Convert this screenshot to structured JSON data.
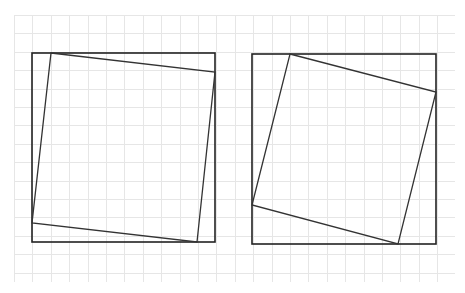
{
  "diagram": {
    "background": "#ffffff",
    "grid": {
      "x0": 14,
      "y0": 15,
      "x1": 455,
      "y1": 282,
      "spacing": 18.4,
      "color": "#e6e6e6"
    },
    "colors": {
      "outer_stroke": "#222222",
      "inner_stroke": "#333333"
    },
    "figures": [
      {
        "name": "left-figure",
        "outer_square": {
          "x": 32,
          "y": 53,
          "width": 183,
          "height": 189
        },
        "inner_square_points": [
          [
            51,
            53
          ],
          [
            215,
            72
          ],
          [
            197,
            242
          ],
          [
            32,
            223
          ]
        ]
      },
      {
        "name": "right-figure",
        "outer_square": {
          "x": 252,
          "y": 54,
          "width": 184,
          "height": 190
        },
        "inner_square_points": [
          [
            290,
            54
          ],
          [
            436,
            92
          ],
          [
            398,
            244
          ],
          [
            252,
            205
          ]
        ]
      }
    ]
  }
}
